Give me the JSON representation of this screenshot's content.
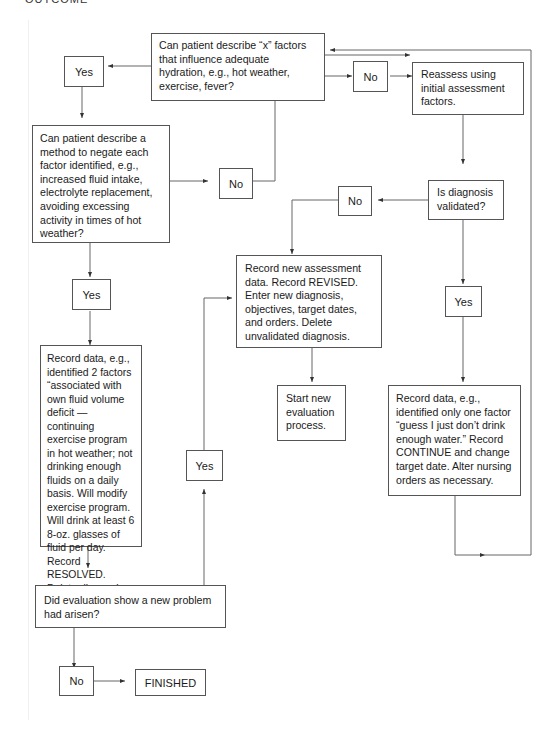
{
  "header": {
    "clipped_text": "OUTCOME"
  },
  "nodes": {
    "q1": "Can patient describe “x” factors that influence adequate hydration, e.g., hot weather, exercise, fever?",
    "q1_yes": "Yes",
    "q1_no": "No",
    "reassess": "Reassess using initial assessment factors.",
    "q2": "Can patient describe a method to negate each factor identified, e.g., increased fluid intake, electrolyte replacement, avoiding excessing activity in times of hot weather?",
    "q2_no": "No",
    "q2_yes": "Yes",
    "validated": "Is diagnosis validated?",
    "validated_no": "No",
    "validated_yes": "Yes",
    "revised": "Record new assessment data. Record REVISED. Enter new diagnosis, objectives, target dates, and orders. Delete unvalidated diagnosis.",
    "start_new": "Start new evaluation process.",
    "resolved": "Record data, e.g., identified 2 factors “associated with own fluid volume deficit — continuing exercise program in hot weather; not drinking enough fluids on a daily basis. Will modify exercise program. Will drink at least 6 8-oz. glasses of fluid per day. Record RESOLVED. Delete diagnosis, objectives, target date, and orders.",
    "continue": "Record data, e.g., identified only one factor “guess I just don’t drink enough water.” Record CONTINUE and change target date. Alter nursing orders as necessary.",
    "new_problem": "Did evaluation show a new problem had arisen?",
    "new_problem_yes": "Yes",
    "new_problem_no": "No",
    "finished": "FINISHED"
  },
  "colors": {
    "line": "#555555",
    "background": "#ffffff",
    "text": "#1a1a1a"
  }
}
